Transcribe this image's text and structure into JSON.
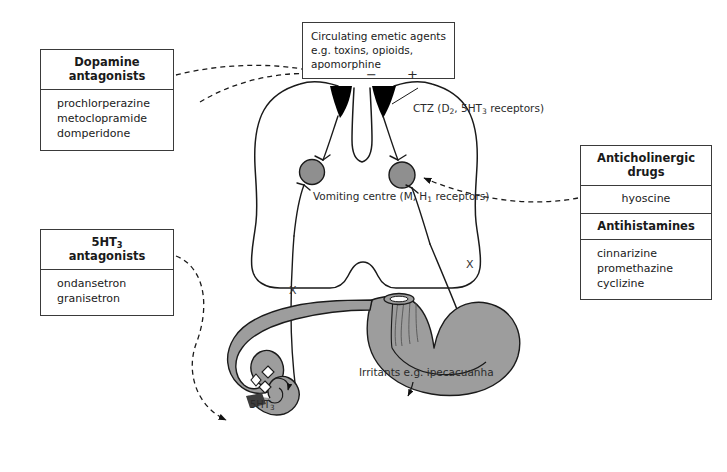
{
  "diagram": {
    "colors": {
      "organ_fill": "#9d9d9d",
      "outline": "#1a1a1a",
      "nucleus_fill": "#8f8f8f",
      "ctz_fill": "#000000",
      "dashed_stroke": "#1a1a1a",
      "box_border": "#3a3a3a",
      "background": "#ffffff"
    }
  },
  "boxes": {
    "emetic_agents": {
      "line1": "Circulating emetic agents",
      "line2": "e.g. toxins, opioids, apomorphine"
    },
    "dopamine": {
      "header_line1": "Dopamine",
      "header_line2": "antagonists",
      "drugs": [
        "prochlorperazine",
        "metoclopramide",
        "domperidone"
      ]
    },
    "ht3": {
      "header_line1": "5HT",
      "header_sub": "3",
      "header_line2": "antagonists",
      "drugs": [
        "ondansetron",
        "granisetron"
      ]
    },
    "anticholinergic": {
      "header_line1": "Anticholinergic",
      "header_line2": "drugs",
      "drugs": [
        "hyoscine"
      ],
      "second_header": "Antihistamines",
      "second_drugs": [
        "cinnarizine",
        "promethazine",
        "cyclizine"
      ]
    }
  },
  "labels": {
    "ctz": "CTZ",
    "ctz_receptors_pre": "(D",
    "ctz_receptors_sub1": "2",
    "ctz_receptors_mid": ", 5HT",
    "ctz_receptors_sub2": "3",
    "ctz_receptors_post": "",
    "ctz_receptors_line2": "receptors)",
    "vomiting_centre": "Vomiting centre",
    "vomiting_receptors_pre": "(M, H",
    "vomiting_receptors_sub": "1",
    "vomiting_receptors_post": " receptors)",
    "irritants_line1": "Irritants",
    "irritants_line2": "e.g. ipecacuanha",
    "gut_5ht_pre": "5HT",
    "gut_5ht_sub": "3",
    "minus_sign": "−",
    "plus_sign": "+",
    "vagus_left": "X",
    "vagus_right": "X"
  }
}
